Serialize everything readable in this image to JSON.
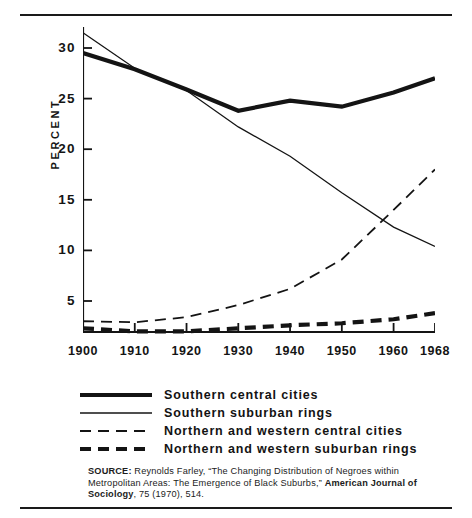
{
  "chart_data": {
    "type": "line",
    "title": "",
    "xlabel": "",
    "ylabel": "PERCENT",
    "x": [
      1900,
      1910,
      1920,
      1930,
      1940,
      1950,
      1960,
      1968
    ],
    "xtick_labels": [
      "1900",
      "1910",
      "1920",
      "1930",
      "1940",
      "1950",
      "1960",
      "1968"
    ],
    "ytick_labels": [
      "5",
      "10",
      "15",
      "20",
      "25",
      "30"
    ],
    "yticks": [
      5,
      10,
      15,
      20,
      25,
      30
    ],
    "xlim": [
      1900,
      1968
    ],
    "ylim": [
      0,
      33
    ],
    "grid": false,
    "legend_position": "below-plot",
    "series": [
      {
        "name": "Southern central cities",
        "style": "thick-solid",
        "values": [
          29.5,
          27.9,
          25.9,
          23.8,
          24.8,
          24.2,
          25.6,
          27.0
        ]
      },
      {
        "name": "Southern suburban rings",
        "style": "thin-solid",
        "values": [
          31.5,
          28.0,
          25.8,
          22.2,
          19.3,
          15.7,
          12.3,
          10.4
        ]
      },
      {
        "name": "Northern and western central cities",
        "style": "thin-dashed",
        "values": [
          3.0,
          2.9,
          3.4,
          4.6,
          6.2,
          9.1,
          14.0,
          18.0
        ]
      },
      {
        "name": "Northern and western suburban rings",
        "style": "thick-dashed",
        "values": [
          2.3,
          2.0,
          2.0,
          2.3,
          2.6,
          2.8,
          3.2,
          3.8
        ]
      }
    ]
  },
  "legend": {
    "items": [
      {
        "label": "Southern central cities",
        "style": "thick-solid"
      },
      {
        "label": "Southern suburban rings",
        "style": "thin-solid"
      },
      {
        "label": "Northern and western central cities",
        "style": "thin-dashed"
      },
      {
        "label": "Northern and western suburban rings",
        "style": "thick-dashed"
      }
    ]
  },
  "source": {
    "prefix": "SOURCE:",
    "text_1": " Reynolds Farley, “The Changing Distribution of Negroes within Metropolitan Areas: The Emergence of Black Suburbs,” ",
    "emphasis": "American Journal of Sociology",
    "text_2": ", 75 (1970), 514."
  },
  "colors": {
    "ink": "#141414",
    "background": "#ffffff"
  }
}
